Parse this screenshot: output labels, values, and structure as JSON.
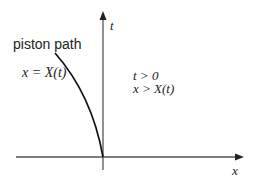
{
  "diagram": {
    "labels": {
      "curve_title": "piston path",
      "curve_equation": "x = X(t)",
      "t_axis": "t",
      "x_axis": "x",
      "condition_t": "t > 0",
      "condition_x": "x > X(t)"
    },
    "colors": {
      "axis": "#555555",
      "curve": "#111111",
      "text": "#222222"
    }
  }
}
